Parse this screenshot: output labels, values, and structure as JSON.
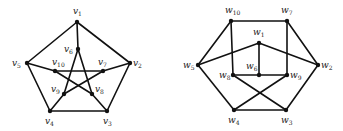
{
  "graphs": [
    {
      "name": "petersen-v",
      "prefix": "v",
      "nodes": [
        {
          "id": "1",
          "x": 77,
          "y": 22,
          "lx": 73,
          "ly": 14
        },
        {
          "id": "2",
          "x": 130,
          "y": 63,
          "lx": 133,
          "ly": 66
        },
        {
          "id": "3",
          "x": 107,
          "y": 111,
          "lx": 103,
          "ly": 124
        },
        {
          "id": "4",
          "x": 50,
          "y": 111,
          "lx": 45,
          "ly": 124
        },
        {
          "id": "5",
          "x": 27,
          "y": 63,
          "lx": 12,
          "ly": 66
        },
        {
          "id": "6",
          "x": 78,
          "y": 49,
          "lx": 64,
          "ly": 52
        },
        {
          "id": "7",
          "x": 103,
          "y": 71,
          "lx": 98,
          "ly": 65
        },
        {
          "id": "8",
          "x": 92,
          "y": 94,
          "lx": 95,
          "ly": 92
        },
        {
          "id": "9",
          "x": 64,
          "y": 94,
          "lx": 51,
          "ly": 92
        },
        {
          "id": "10",
          "x": 55,
          "y": 71,
          "lx": 52,
          "ly": 65
        }
      ],
      "edges": [
        [
          "1",
          "2"
        ],
        [
          "2",
          "3"
        ],
        [
          "3",
          "4"
        ],
        [
          "4",
          "5"
        ],
        [
          "5",
          "1"
        ],
        [
          "1",
          "6"
        ],
        [
          "2",
          "7"
        ],
        [
          "3",
          "8"
        ],
        [
          "4",
          "9"
        ],
        [
          "5",
          "10"
        ],
        [
          "6",
          "8"
        ],
        [
          "6",
          "9"
        ],
        [
          "7",
          "10"
        ],
        [
          "7",
          "9"
        ],
        [
          "10",
          "8"
        ]
      ]
    },
    {
      "name": "petersen-w",
      "prefix": "w",
      "nodes": [
        {
          "id": "1",
          "x": 259,
          "y": 43,
          "lx": 253,
          "ly": 35
        },
        {
          "id": "2",
          "x": 318,
          "y": 65,
          "lx": 321,
          "ly": 68
        },
        {
          "id": "3",
          "x": 286,
          "y": 110,
          "lx": 281,
          "ly": 123
        },
        {
          "id": "4",
          "x": 234,
          "y": 110,
          "lx": 228,
          "ly": 123
        },
        {
          "id": "5",
          "x": 198,
          "y": 65,
          "lx": 183,
          "ly": 68
        },
        {
          "id": "6",
          "x": 259,
          "y": 75,
          "lx": 246,
          "ly": 69
        },
        {
          "id": "7",
          "x": 287,
          "y": 21,
          "lx": 281,
          "ly": 13
        },
        {
          "id": "8",
          "x": 233,
          "y": 75,
          "lx": 219,
          "ly": 78
        },
        {
          "id": "9",
          "x": 287,
          "y": 75,
          "lx": 290,
          "ly": 78
        },
        {
          "id": "10",
          "x": 231,
          "y": 21,
          "lx": 225,
          "ly": 13
        }
      ],
      "edges": [
        [
          "10",
          "7"
        ],
        [
          "10",
          "5"
        ],
        [
          "7",
          "2"
        ],
        [
          "10",
          "8"
        ],
        [
          "7",
          "9"
        ],
        [
          "1",
          "5"
        ],
        [
          "1",
          "2"
        ],
        [
          "1",
          "6"
        ],
        [
          "8",
          "6"
        ],
        [
          "6",
          "9"
        ],
        [
          "5",
          "4"
        ],
        [
          "2",
          "3"
        ],
        [
          "4",
          "3"
        ],
        [
          "8",
          "3"
        ],
        [
          "9",
          "4"
        ]
      ]
    }
  ]
}
